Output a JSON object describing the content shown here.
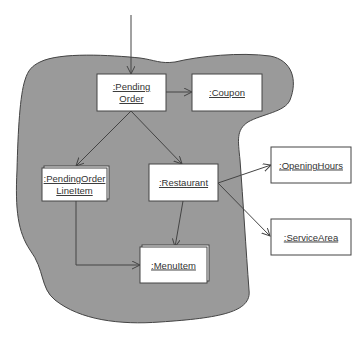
{
  "diagram": {
    "type": "uml-object-collaboration",
    "boundary_fill": "#9a9a9a",
    "boundary_stroke": "#444444",
    "object_fill": "#ffffff",
    "line_color": "#444444",
    "objects": [
      {
        "id": "pending-order",
        "lines": [
          ":Pending",
          "Order"
        ],
        "multi": false
      },
      {
        "id": "coupon",
        "lines": [
          ":Coupon"
        ],
        "multi": false
      },
      {
        "id": "pending-order-lineitem",
        "lines": [
          ":PendingOrder",
          "LineItem"
        ],
        "multi": true
      },
      {
        "id": "restaurant",
        "lines": [
          ":Restaurant"
        ],
        "multi": false
      },
      {
        "id": "menu-item",
        "lines": [
          ":MenuItem"
        ],
        "multi": true
      },
      {
        "id": "opening-hours",
        "lines": [
          ":OpeningHours"
        ],
        "multi": false
      },
      {
        "id": "service-area",
        "lines": [
          ":ServiceArea"
        ],
        "multi": false
      }
    ],
    "links": [
      {
        "from": "external",
        "to": "pending-order"
      },
      {
        "from": "pending-order",
        "to": "coupon"
      },
      {
        "from": "pending-order",
        "to": "pending-order-lineitem"
      },
      {
        "from": "pending-order",
        "to": "restaurant"
      },
      {
        "from": "pending-order-lineitem",
        "to": "menu-item"
      },
      {
        "from": "restaurant",
        "to": "menu-item"
      },
      {
        "from": "restaurant",
        "to": "opening-hours"
      },
      {
        "from": "restaurant",
        "to": "service-area"
      }
    ]
  }
}
